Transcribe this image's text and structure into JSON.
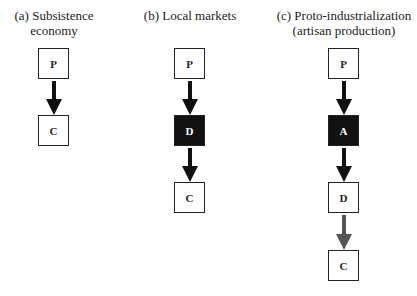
{
  "panels": [
    {
      "title_line1": "(a) Subsistence",
      "title_line2": "economy",
      "nodes": [
        "P",
        "C"
      ]
    },
    {
      "title_line1": "(b) Local markets",
      "title_line2": "",
      "nodes": [
        "P",
        "D",
        "C"
      ]
    },
    {
      "title_line1": "(c) Proto-industrialization",
      "title_line2": "(artisan production)",
      "nodes": [
        "P",
        "A",
        "D",
        "C"
      ]
    }
  ],
  "colors": {
    "box_border": "#222222",
    "dark_fill": "#111111",
    "arrow": "#111111",
    "arrow_gray": "#555555"
  }
}
